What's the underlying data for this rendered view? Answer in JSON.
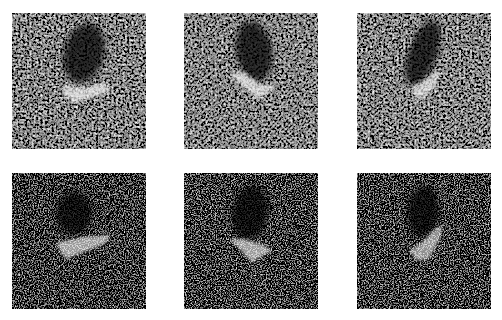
{
  "grid": {
    "rows": 2,
    "cols": 3,
    "background": "#ffffff",
    "panels": [
      {
        "id": "r1c1",
        "row": 1,
        "col": 1,
        "x": 12,
        "y": 13,
        "noise": "coarse",
        "seed": 3,
        "shadow": {
          "cx": 72,
          "cy": 40,
          "rx": 20,
          "ry": 30,
          "rot": 15
        },
        "target": {
          "points": "50,80 62,90 100,78 92,70 70,75 54,72",
          "opacity": 0.95
        }
      },
      {
        "id": "r1c2",
        "row": 1,
        "col": 2,
        "x": 184,
        "y": 13,
        "noise": "coarse",
        "seed": 7,
        "shadow": {
          "cx": 70,
          "cy": 38,
          "rx": 18,
          "ry": 30,
          "rot": -10
        },
        "target": {
          "points": "46,62 58,58 76,72 92,72 84,80 74,86",
          "opacity": 0.95
        }
      },
      {
        "id": "r1c3",
        "row": 1,
        "col": 3,
        "x": 357,
        "y": 13,
        "noise": "coarse",
        "seed": 11,
        "shadow": {
          "cx": 66,
          "cy": 40,
          "rx": 14,
          "ry": 34,
          "rot": 20
        },
        "target": {
          "points": "54,74 64,70 78,60 84,56 78,74 68,84 60,86",
          "opacity": 0.9
        }
      },
      {
        "id": "r2c1",
        "row": 2,
        "col": 1,
        "x": 12,
        "y": 173,
        "noise": "fine",
        "seed": 5,
        "shadow": {
          "cx": 62,
          "cy": 40,
          "rx": 18,
          "ry": 22,
          "rot": 0
        },
        "target": {
          "points": "44,70 72,64 98,62 94,70 70,80 54,86 48,78",
          "opacity": 0.85
        }
      },
      {
        "id": "r2c2",
        "row": 2,
        "col": 2,
        "x": 184,
        "y": 173,
        "noise": "fine",
        "seed": 9,
        "shadow": {
          "cx": 66,
          "cy": 40,
          "rx": 18,
          "ry": 28,
          "rot": 10
        },
        "target": {
          "points": "46,66 60,66 80,72 88,78 76,84 68,90",
          "opacity": 0.85
        }
      },
      {
        "id": "r2c3",
        "row": 2,
        "col": 3,
        "x": 357,
        "y": 173,
        "noise": "fine",
        "seed": 13,
        "shadow": {
          "cx": 66,
          "cy": 38,
          "rx": 16,
          "ry": 26,
          "rot": 5
        },
        "target": {
          "points": "52,78 64,70 78,56 86,52 82,68 72,86 60,88",
          "opacity": 0.8
        }
      }
    ]
  }
}
